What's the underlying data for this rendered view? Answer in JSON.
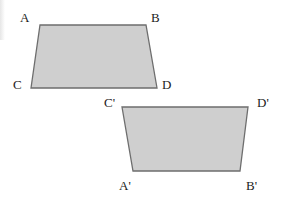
{
  "figure": {
    "shapes": [
      {
        "name": "quadrilateral-ABCD",
        "fill": "#cfcfcf",
        "stroke": "#6e6e6e",
        "points": [
          [
            40,
            25
          ],
          [
            146,
            25
          ],
          [
            157,
            88
          ],
          [
            31,
            88
          ]
        ],
        "labels": [
          {
            "text": "A",
            "x": 20,
            "y": 22
          },
          {
            "text": "B",
            "x": 151,
            "y": 22
          },
          {
            "text": "C",
            "x": 13,
            "y": 89
          },
          {
            "text": "D",
            "x": 162,
            "y": 89
          }
        ]
      },
      {
        "name": "quadrilateral-A'B'C'D'",
        "fill": "#cfcfcf",
        "stroke": "#6e6e6e",
        "points": [
          [
            122,
            107
          ],
          [
            248,
            107
          ],
          [
            240,
            171
          ],
          [
            133,
            171
          ]
        ],
        "labels": [
          {
            "text": "C'",
            "x": 104,
            "y": 107
          },
          {
            "text": "D'",
            "x": 257,
            "y": 107
          },
          {
            "text": "A'",
            "x": 119,
            "y": 190
          },
          {
            "text": "B'",
            "x": 246,
            "y": 190
          }
        ]
      }
    ]
  }
}
